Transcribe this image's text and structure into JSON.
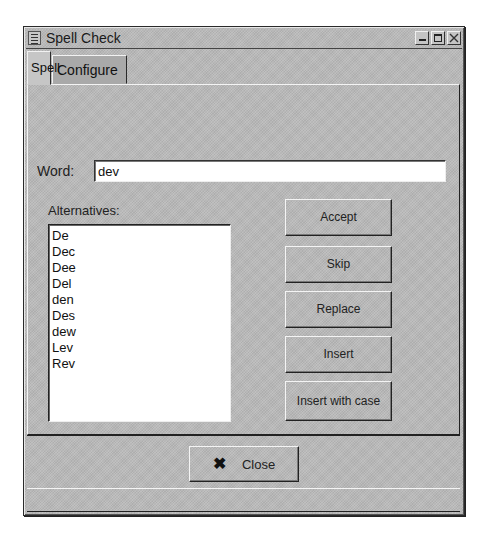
{
  "window": {
    "title": "Spell Check",
    "menu_icon": "window-menu-icon",
    "controls": [
      "minimize-icon",
      "maximize-icon",
      "close-icon"
    ]
  },
  "tabs": [
    {
      "label": "Spell",
      "active": true
    },
    {
      "label": "Configure",
      "active": false
    }
  ],
  "spell": {
    "word_label": "Word:",
    "word_value": "dev",
    "alternatives_label": "Alternatives:",
    "alternatives": [
      "De",
      "Dec",
      "Dee",
      "Del",
      "den",
      "Des",
      "dew",
      "Lev",
      "Rev"
    ],
    "buttons": {
      "accept": "Accept",
      "skip": "Skip",
      "replace": "Replace",
      "insert": "Insert",
      "insert_with_case": "Insert with case"
    }
  },
  "footer": {
    "close_label": "Close",
    "close_icon": "x-icon",
    "status_text": ""
  },
  "colors": {
    "window_bg": "#b9b9b9",
    "inactive_tab_bg": "#a9a9a9",
    "input_bg": "#ffffff"
  }
}
